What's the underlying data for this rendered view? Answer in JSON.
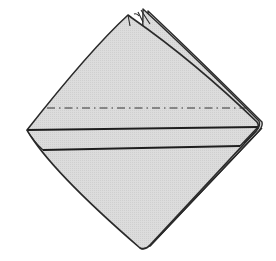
{
  "figure": {
    "title": "Folded napkin diagram",
    "colors": {
      "paper": "#d9d9d9",
      "outline": "#2a2a2a",
      "background": "#ffffff"
    },
    "elements": {
      "napkin": "napkin-diamond",
      "layers": "layered-top-corner",
      "fold_line": "dash-dot-fold-line",
      "band": "folded-band"
    }
  }
}
